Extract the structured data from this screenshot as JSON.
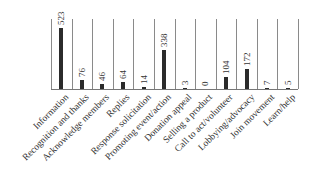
{
  "chart_data": {
    "type": "bar",
    "title": "",
    "xlabel": "",
    "ylabel": "",
    "grid": "vertical separators",
    "legend": null,
    "categories": [
      "Information",
      "Recognition and thanks",
      "Acknowledge members",
      "Replies",
      "Response solicitation",
      "Promoting event/action",
      "Donation appeal",
      "Selling a product",
      "Call to act/volunteer",
      "Lobbying/advocacy",
      "Join movement",
      "Learn/help"
    ],
    "values": [
      523,
      76,
      46,
      64,
      14,
      338,
      3,
      0,
      104,
      172,
      7,
      5
    ],
    "data_labels": [
      "523",
      "76",
      "46",
      "64",
      "14",
      "338",
      "3",
      "0",
      "104",
      "172",
      "7",
      "5"
    ],
    "ylim": [
      0,
      560
    ],
    "bar_color": "#2b2b2b",
    "gridline_color": "#8a8a8a"
  }
}
